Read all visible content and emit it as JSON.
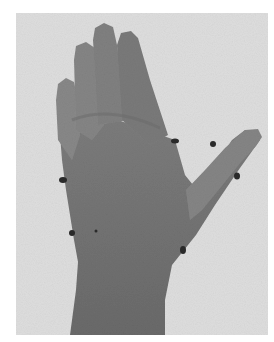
{
  "image": {
    "subject": "Back of a left hand with wrist and forearm, fingers spread, dark skin markers placed around joints",
    "style": "grayscale photograph",
    "colors": {
      "page_background": "#ffffff",
      "photo_background": "#dedede",
      "skin_mid": "#7d7d7d",
      "skin_dark": "#5a5a5a",
      "skin_light": "#9a9a9a",
      "marker": "#2a2a2a"
    },
    "markers": [
      {
        "id": "m1",
        "x": 175,
        "y": 141
      },
      {
        "id": "m2",
        "x": 213,
        "y": 144
      },
      {
        "id": "m3",
        "x": 237,
        "y": 176
      },
      {
        "id": "m4",
        "x": 63,
        "y": 180
      },
      {
        "id": "m5",
        "x": 72,
        "y": 233
      },
      {
        "id": "m6",
        "x": 96,
        "y": 231
      },
      {
        "id": "m7",
        "x": 183,
        "y": 250
      }
    ]
  }
}
